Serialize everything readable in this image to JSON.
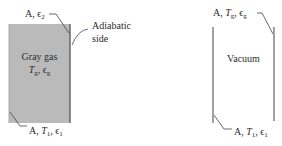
{
  "colors": {
    "gas_fill": "#bababa",
    "wall_line": "#555555",
    "leader_line": "#444444",
    "text": "#2a2a2a"
  },
  "left_diagram": {
    "top_label": {
      "area": "A",
      "emissivity": "ϵ",
      "emissivity_sub": "2"
    },
    "side_label": {
      "line1": "Adiabatic",
      "line2": "side"
    },
    "gas_label": "Gray gas",
    "gas_props": {
      "temp": "T",
      "temp_sub": "g",
      "emissivity": "ϵ",
      "emissivity_sub": "g"
    },
    "bottom_label": {
      "area": "A",
      "temp": "T",
      "temp_sub": "1",
      "emissivity": "ϵ",
      "emissivity_sub": "1"
    }
  },
  "right_diagram": {
    "top_label": {
      "area": "A",
      "temp": "T",
      "temp_sub": "g",
      "emissivity": "ϵ",
      "emissivity_sub": "g"
    },
    "center_label": "Vacuum",
    "bottom_label": {
      "area": "A",
      "temp": "T",
      "temp_sub": "1",
      "emissivity": "ϵ",
      "emissivity_sub": "1"
    }
  }
}
